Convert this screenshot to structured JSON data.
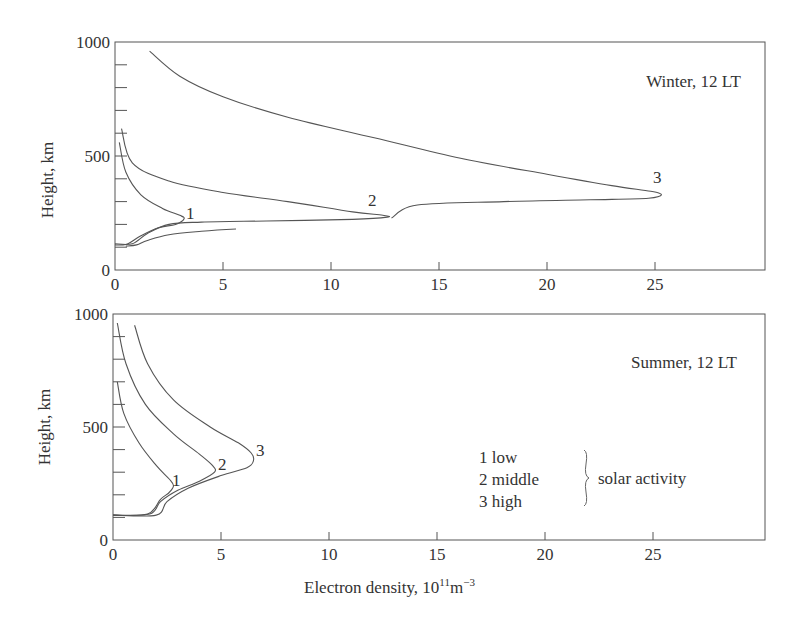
{
  "figure": {
    "xlabel": "Electron density, 10",
    "xlabel_exp": "11",
    "xlabel_unit": "m",
    "xlabel_unit_exp": "−3",
    "ylabel": "Height, km",
    "legend": {
      "items": [
        "1 low",
        "2 middle",
        "3 high"
      ],
      "group_label": "solar activity"
    }
  },
  "chart_data": [
    {
      "type": "line",
      "title": "Winter, 12 LT",
      "xlabel": "Electron density, 10^11 m^-3",
      "ylabel": "Height, km",
      "xlim": [
        0,
        30
      ],
      "ylim": [
        0,
        1000
      ],
      "xticks": [
        0,
        5,
        10,
        15,
        20,
        25
      ],
      "yticks": [
        0,
        500,
        1000
      ],
      "grid": false,
      "series": [
        {
          "name": "1",
          "label": "low solar activity",
          "points": [
            [
              0.2,
              560
            ],
            [
              0.5,
              430
            ],
            [
              1.2,
              330
            ],
            [
              2.2,
              270
            ],
            [
              3.0,
              240
            ],
            [
              3.2,
              225
            ],
            [
              2.8,
              200
            ],
            [
              2.0,
              185
            ],
            [
              1.2,
              150
            ],
            [
              0.6,
              115
            ],
            [
              0.3,
              110
            ],
            [
              0,
              110
            ]
          ]
        },
        {
          "name": "2",
          "label": "middle solar activity",
          "points": [
            [
              0.3,
              620
            ],
            [
              0.8,
              470
            ],
            [
              2.5,
              390
            ],
            [
              5,
              340
            ],
            [
              8,
              300
            ],
            [
              11,
              255
            ],
            [
              12.4,
              240
            ],
            [
              12.6,
              232
            ],
            [
              11,
              222
            ],
            [
              7,
              215
            ],
            [
              4,
              210
            ],
            [
              2.5,
              200
            ],
            [
              1.5,
              160
            ],
            [
              0.8,
              115
            ],
            [
              0,
              115
            ]
          ]
        },
        {
          "name": "3",
          "label": "high solar activity",
          "points": [
            [
              1.6,
              960
            ],
            [
              3,
              850
            ],
            [
              5,
              760
            ],
            [
              8,
              670
            ],
            [
              12,
              580
            ],
            [
              16,
              490
            ],
            [
              20,
              420
            ],
            [
              23,
              370
            ],
            [
              24.8,
              345
            ],
            [
              25.3,
              330
            ],
            [
              24.7,
              315
            ],
            [
              22,
              308
            ],
            [
              18,
              300
            ],
            [
              14,
              285
            ],
            [
              12.8,
              228
            ]
          ],
          "lower_branch": [
            [
              5.6,
              180
            ],
            [
              4,
              170
            ],
            [
              2.5,
              155
            ],
            [
              1.5,
              130
            ],
            [
              1,
              110
            ],
            [
              0.5,
              105
            ]
          ]
        }
      ]
    },
    {
      "type": "line",
      "title": "Summer, 12 LT",
      "xlabel": "Electron density, 10^11 m^-3",
      "ylabel": "Height, km",
      "xlim": [
        0,
        30
      ],
      "ylim": [
        0,
        1000
      ],
      "xticks": [
        0,
        5,
        10,
        15,
        20,
        25
      ],
      "yticks": [
        0,
        500,
        1000
      ],
      "grid": false,
      "series": [
        {
          "name": "1",
          "label": "low solar activity",
          "points": [
            [
              0.2,
              700
            ],
            [
              0.5,
              560
            ],
            [
              1.2,
              430
            ],
            [
              2.0,
              330
            ],
            [
              2.6,
              270
            ],
            [
              2.8,
              240
            ],
            [
              2.6,
              210
            ],
            [
              2.2,
              180
            ],
            [
              1.6,
              115
            ],
            [
              0,
              110
            ]
          ]
        },
        {
          "name": "2",
          "label": "middle solar activity",
          "points": [
            [
              0.2,
              960
            ],
            [
              0.6,
              780
            ],
            [
              1.5,
              600
            ],
            [
              2.8,
              470
            ],
            [
              4.0,
              380
            ],
            [
              4.6,
              330
            ],
            [
              4.7,
              300
            ],
            [
              4.0,
              260
            ],
            [
              3.0,
              220
            ],
            [
              2.2,
              170
            ],
            [
              1.7,
              115
            ],
            [
              0,
              110
            ]
          ]
        },
        {
          "name": "3",
          "label": "high solar activity",
          "points": [
            [
              1.0,
              950
            ],
            [
              1.6,
              780
            ],
            [
              2.8,
              620
            ],
            [
              4.5,
              500
            ],
            [
              5.8,
              430
            ],
            [
              6.4,
              385
            ],
            [
              6.5,
              350
            ],
            [
              6.2,
              320
            ],
            [
              5.0,
              285
            ],
            [
              3.5,
              230
            ],
            [
              2.5,
              170
            ],
            [
              2.0,
              110
            ],
            [
              0,
              110
            ]
          ]
        }
      ]
    }
  ]
}
